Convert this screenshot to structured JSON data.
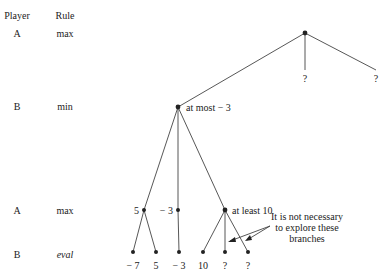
{
  "header": {
    "player": "Player",
    "rule": "Rule"
  },
  "levels": [
    {
      "player": "A",
      "rule": "max"
    },
    {
      "player": "B",
      "rule": "min"
    },
    {
      "player": "A",
      "rule": "max"
    },
    {
      "player": "B",
      "rule": "eval"
    }
  ],
  "root_children": [
    "?",
    "?"
  ],
  "b_node_label": "at most  − 3",
  "a_nodes": [
    {
      "label": "5"
    },
    {
      "label": "− 3"
    },
    {
      "label": "at least 10"
    }
  ],
  "leaves": [
    "− 7",
    "5",
    "− 3",
    "10",
    "?",
    "?"
  ],
  "annotation": [
    "It is not necessary",
    "to explore these",
    "branches"
  ]
}
